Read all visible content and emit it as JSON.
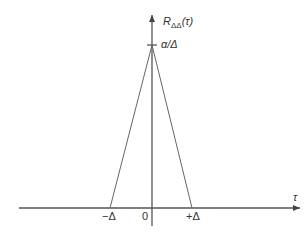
{
  "diagram": {
    "type": "triangular-autocorrelation",
    "y_axis_label": {
      "base": "R",
      "subscript": "ΔΔ",
      "arg": "(τ)"
    },
    "x_axis_label": "τ",
    "peak_label": "α/Δ",
    "tick_labels": {
      "left": "−Δ",
      "origin": "0",
      "right": "+Δ"
    },
    "function": {
      "shape": "triangle",
      "points": [
        {
          "tau": "-Δ",
          "value": 0
        },
        {
          "tau": 0,
          "value": "α/Δ"
        },
        {
          "tau": "+Δ",
          "value": 0
        }
      ]
    },
    "colors": {
      "axis": "#555555",
      "curve": "#666666",
      "text": "#333333"
    }
  }
}
